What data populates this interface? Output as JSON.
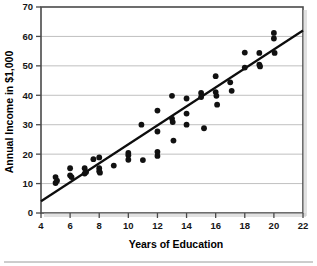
{
  "chart_data": {
    "type": "scatter",
    "title": "",
    "xlabel": "Years of Education",
    "ylabel": "Annual Income in $1,000",
    "xlim": [
      4,
      22
    ],
    "ylim": [
      0,
      70
    ],
    "xticks": [
      4,
      6,
      8,
      10,
      12,
      14,
      16,
      18,
      20,
      22
    ],
    "xtick_labels": [
      "4",
      "6",
      "8",
      "10",
      "12",
      "14",
      "16",
      "18",
      "20",
      "22"
    ],
    "yticks": [
      0,
      10,
      20,
      30,
      40,
      50,
      60,
      70
    ],
    "ytick_labels": [
      "0",
      "10",
      "20",
      "30",
      "40",
      "50",
      "60",
      "70"
    ],
    "grid": "horizontal",
    "legend": "none",
    "marker": "filled-circle",
    "marker_color": "#111111",
    "points": [
      [
        5.0,
        12.2
      ],
      [
        5.0,
        10.2
      ],
      [
        5.1,
        11.0
      ],
      [
        6.0,
        15.2
      ],
      [
        6.0,
        12.8
      ],
      [
        6.1,
        12.2
      ],
      [
        7.0,
        15.2
      ],
      [
        7.0,
        13.4
      ],
      [
        7.1,
        13.9
      ],
      [
        7.6,
        18.3
      ],
      [
        8.0,
        18.9
      ],
      [
        8.0,
        15.2
      ],
      [
        8.0,
        14.2
      ],
      [
        8.05,
        13.7
      ],
      [
        9.0,
        16.1
      ],
      [
        10.0,
        20.4
      ],
      [
        10.0,
        19.6
      ],
      [
        10.0,
        18.1
      ],
      [
        10.9,
        30.0
      ],
      [
        11.0,
        18.0
      ],
      [
        12.0,
        34.8
      ],
      [
        12.0,
        27.7
      ],
      [
        12.0,
        20.8
      ],
      [
        12.0,
        19.4
      ],
      [
        13.0,
        39.8
      ],
      [
        13.0,
        32.1
      ],
      [
        13.05,
        30.9
      ],
      [
        13.1,
        24.6
      ],
      [
        14.0,
        38.9
      ],
      [
        14.0,
        33.8
      ],
      [
        14.0,
        30.0
      ],
      [
        15.0,
        40.8
      ],
      [
        15.0,
        39.4
      ],
      [
        15.2,
        28.8
      ],
      [
        16.0,
        46.5
      ],
      [
        16.0,
        41.1
      ],
      [
        16.05,
        39.8
      ],
      [
        16.1,
        36.8
      ],
      [
        17.0,
        44.4
      ],
      [
        17.1,
        41.5
      ],
      [
        18.0,
        54.5
      ],
      [
        18.0,
        49.4
      ],
      [
        19.0,
        54.4
      ],
      [
        19.0,
        50.4
      ],
      [
        19.05,
        49.8
      ],
      [
        20.0,
        61.2
      ],
      [
        20.0,
        59.3
      ],
      [
        20.05,
        54.4
      ]
    ],
    "trendline": {
      "x": [
        4,
        22
      ],
      "y": [
        4.0,
        62.0
      ],
      "color": "#0d0d0d",
      "style": "solid"
    }
  },
  "axes": {
    "y_title": "Annual Income in $1,000",
    "x_title": "Years of Education"
  }
}
